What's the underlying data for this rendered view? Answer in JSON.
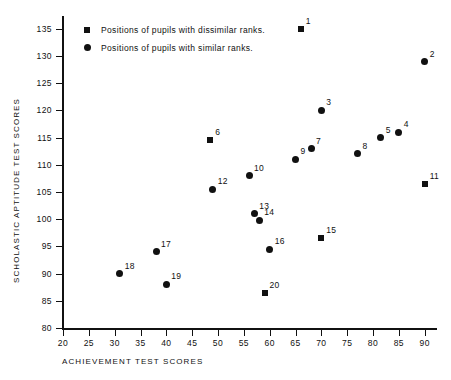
{
  "chart_data": {
    "type": "scatter",
    "title": "",
    "xlabel": "ACHIEVEMENT TEST SCORES",
    "ylabel": "SCHOLASTIC APTITUDE TEST SCORES",
    "xlim": [
      20,
      92
    ],
    "ylim": [
      80,
      137
    ],
    "grid": false,
    "legend_position": "top-left",
    "xticks": [
      20,
      25,
      30,
      35,
      40,
      45,
      50,
      55,
      60,
      65,
      70,
      75,
      80,
      85,
      90
    ],
    "yticks": [
      80,
      85,
      90,
      95,
      100,
      105,
      110,
      115,
      120,
      125,
      130,
      135
    ],
    "series": [
      {
        "name": "Positions of pupils with dissimilar ranks.",
        "marker": "square",
        "points": [
          {
            "label": "1",
            "x": 66,
            "y": 135
          },
          {
            "label": "6",
            "x": 48.5,
            "y": 114.5
          },
          {
            "label": "11",
            "x": 90,
            "y": 106.5
          },
          {
            "label": "15",
            "x": 70,
            "y": 96.5
          },
          {
            "label": "20",
            "x": 59,
            "y": 86.5
          }
        ]
      },
      {
        "name": "Positions of pupils with similar ranks.",
        "marker": "circle",
        "points": [
          {
            "label": "2",
            "x": 90,
            "y": 129
          },
          {
            "label": "3",
            "x": 70,
            "y": 120
          },
          {
            "label": "4",
            "x": 85,
            "y": 116
          },
          {
            "label": "5",
            "x": 81.5,
            "y": 115
          },
          {
            "label": "7",
            "x": 68,
            "y": 113
          },
          {
            "label": "8",
            "x": 77,
            "y": 112
          },
          {
            "label": "9",
            "x": 65,
            "y": 111
          },
          {
            "label": "10",
            "x": 56,
            "y": 108
          },
          {
            "label": "12",
            "x": 49,
            "y": 105.5
          },
          {
            "label": "13",
            "x": 57,
            "y": 101
          },
          {
            "label": "14",
            "x": 58,
            "y": 99.8
          },
          {
            "label": "16",
            "x": 60,
            "y": 94.5
          },
          {
            "label": "17",
            "x": 38,
            "y": 94
          },
          {
            "label": "18",
            "x": 31,
            "y": 90
          },
          {
            "label": "19",
            "x": 40,
            "y": 88
          }
        ]
      }
    ]
  },
  "legend": [
    {
      "marker": "square",
      "label": "Positions of pupils with dissimilar ranks."
    },
    {
      "marker": "circle",
      "label": "Positions of pupils with similar ranks."
    }
  ]
}
